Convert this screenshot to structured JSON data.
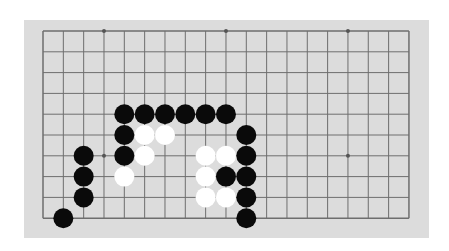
{
  "board": {
    "columns": 19,
    "visible_rows": 10,
    "colors": {
      "background": "#dcdcdc",
      "line": "#6e6e6e",
      "black_stone": "#0a0a0a",
      "white_stone": "#ffffff",
      "star_point": "#555555"
    },
    "star_points": [
      [
        3,
        0
      ],
      [
        9,
        0
      ],
      [
        15,
        0
      ],
      [
        3,
        6
      ],
      [
        15,
        6
      ]
    ],
    "stones": {
      "black": [
        [
          4,
          4
        ],
        [
          5,
          4
        ],
        [
          6,
          4
        ],
        [
          7,
          4
        ],
        [
          8,
          4
        ],
        [
          9,
          4
        ],
        [
          4,
          5
        ],
        [
          10,
          5
        ],
        [
          2,
          6
        ],
        [
          4,
          6
        ],
        [
          10,
          6
        ],
        [
          2,
          7
        ],
        [
          9,
          7
        ],
        [
          10,
          7
        ],
        [
          2,
          8
        ],
        [
          10,
          8
        ],
        [
          1,
          9
        ],
        [
          10,
          9
        ]
      ],
      "white": [
        [
          5,
          5
        ],
        [
          6,
          5
        ],
        [
          5,
          6
        ],
        [
          8,
          6
        ],
        [
          9,
          6
        ],
        [
          4,
          7
        ],
        [
          8,
          7
        ],
        [
          8,
          8
        ],
        [
          9,
          8
        ]
      ]
    }
  }
}
